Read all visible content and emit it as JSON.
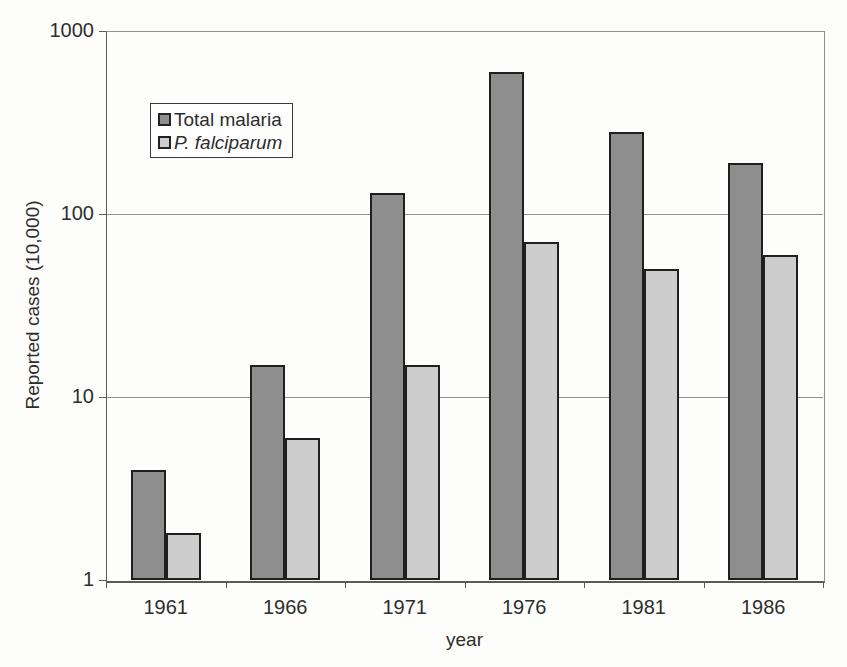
{
  "chart_data": {
    "type": "bar",
    "title": "",
    "xlabel": "year",
    "ylabel": "Reported cases (10,000)",
    "y_scale": "log",
    "ylim": [
      1,
      1000
    ],
    "y_ticks": [
      1,
      10,
      100,
      1000
    ],
    "grid": "horizontal",
    "legend_position": "upper-left-inside",
    "categories": [
      "1961",
      "1966",
      "1971",
      "1976",
      "1981",
      "1986"
    ],
    "series": [
      {
        "name": "Total malaria",
        "italic": false,
        "color": "#8e8e8e",
        "values": [
          4,
          15,
          130,
          600,
          280,
          190
        ]
      },
      {
        "name": "P. falciparum",
        "italic": true,
        "color": "#cdcdcd",
        "values": [
          1.8,
          6,
          15,
          70,
          50,
          60
        ]
      }
    ]
  },
  "appearance": {
    "bar_border_color": "#1f1f1f",
    "gridline_color": "#919191",
    "axis_color": "#5a5a5a",
    "text_color": "#2e2e2e",
    "background_color": "#fdfdfb"
  }
}
